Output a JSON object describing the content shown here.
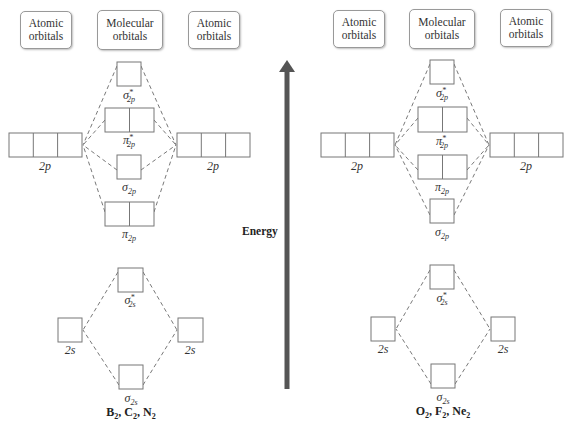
{
  "diagram": {
    "energy_axis": {
      "label": "Energy",
      "color": "#555555",
      "direction": "up"
    },
    "box_border_color": "#777777",
    "panels": [
      {
        "id": "left",
        "headers": [
          "Atomic orbitals",
          "Molecular orbitals",
          "Atomic orbitals"
        ],
        "header_lines": [
          [
            "Atomic",
            "orbitals"
          ],
          [
            "Molecular",
            "orbitals"
          ],
          [
            "Atomic",
            "orbitals"
          ]
        ],
        "species": {
          "parts": [
            [
              "B",
              "2"
            ],
            [
              "C",
              "2"
            ],
            [
              "N",
              "2"
            ]
          ],
          "text": "B2, C2, N2"
        },
        "atomic_labels": {
          "left_2p": "2p",
          "right_2p": "2p",
          "left_2s": "2s",
          "right_2s": "2s"
        },
        "molecular_order_top_to_bottom": [
          "σ*2p",
          "π*2p",
          "σ2p",
          "π2p",
          "σ*2s",
          "σ2s"
        ]
      },
      {
        "id": "right",
        "headers": [
          "Atomic orbitals",
          "Molecular orbitals",
          "Atomic orbitals"
        ],
        "header_lines": [
          [
            "Atomic",
            "orbitals"
          ],
          [
            "Molecular",
            "orbitals"
          ],
          [
            "Atomic",
            "orbitals"
          ]
        ],
        "species": {
          "parts": [
            [
              "O",
              "2"
            ],
            [
              "F",
              "2"
            ],
            [
              "Ne",
              "2"
            ]
          ],
          "text": "O2, F2, Ne2"
        },
        "atomic_labels": {
          "left_2p": "2p",
          "right_2p": "2p",
          "left_2s": "2s",
          "right_2s": "2s"
        },
        "molecular_order_top_to_bottom": [
          "σ*2p",
          "π*2p",
          "π2p",
          "σ2p",
          "σ*2s",
          "σ2s"
        ]
      }
    ],
    "mo_labels": {
      "sigma_star_2p": {
        "sym": "σ",
        "star": "*",
        "sub": "2p"
      },
      "pi_star_2p": {
        "sym": "π",
        "star": "*",
        "sub": "2p"
      },
      "sigma_2p": {
        "sym": "σ",
        "star": "",
        "sub": "2p"
      },
      "pi_2p": {
        "sym": "π",
        "star": "",
        "sub": "2p"
      },
      "sigma_star_2s": {
        "sym": "σ",
        "star": "*",
        "sub": "2s"
      },
      "sigma_2s": {
        "sym": "σ",
        "star": "",
        "sub": "2s"
      }
    }
  }
}
